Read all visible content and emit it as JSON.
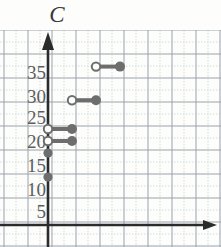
{
  "axis_label": "C",
  "colors": {
    "paper": "#fdfdfc",
    "grid_major": "#9aa3ab",
    "grid_minor": "#c8cfd4",
    "axis": "#2b2b2b",
    "marker": "#6d6d6d",
    "label": "#5d5d5d"
  },
  "chart_data": {
    "type": "line",
    "title": "",
    "xlabel": "",
    "ylabel": "C",
    "grid": true,
    "legend": false,
    "xlim": [
      -2,
      7
    ],
    "ylim": [
      0,
      40
    ],
    "ytick_labels": [
      "35",
      "30",
      "25",
      "20",
      "15",
      "10",
      "5"
    ],
    "ytick_values": [
      35,
      30,
      25,
      20,
      15,
      10,
      5
    ],
    "xtick_labels": [],
    "steps": [
      {
        "x_start": 0,
        "x_end": 0,
        "y": 10,
        "left_endpoint": "closed",
        "right_endpoint": "none"
      },
      {
        "x_start": 0,
        "x_end": 0,
        "y": 15,
        "left_endpoint": "closed",
        "right_endpoint": "none"
      },
      {
        "x_start": 0,
        "x_end": 1,
        "y": 17.5,
        "left_endpoint": "open",
        "right_endpoint": "closed"
      },
      {
        "x_start": 0,
        "x_end": 1,
        "y": 20,
        "left_endpoint": "open",
        "right_endpoint": "closed"
      },
      {
        "x_start": 1,
        "x_end": 2,
        "y": 26,
        "left_endpoint": "open",
        "right_endpoint": "closed"
      },
      {
        "x_start": 2,
        "x_end": 3,
        "y": 33,
        "left_endpoint": "open",
        "right_endpoint": "closed"
      }
    ]
  }
}
